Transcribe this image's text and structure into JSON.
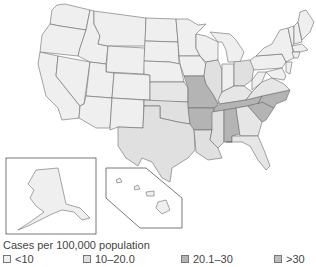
{
  "colors": {
    "lt10": "#efefef",
    "10to20": "#e0e0e0",
    "20to30": "#b4b4b4",
    "gt30": "#bcbcbc",
    "border": "#6a6a6a"
  },
  "legend": {
    "title": "Cases per 100,000 population",
    "items": [
      {
        "label": "<10",
        "class": "lt10"
      },
      {
        "label": "10–20.0",
        "class": "10to20"
      },
      {
        "label": "20.1–30",
        "class": "20to30"
      },
      {
        "label": ">30",
        "class": "gt30"
      }
    ]
  },
  "map": {
    "region": "United States",
    "insets": [
      "Alaska",
      "Hawaii"
    ],
    "states_20_1_to_30": [
      "Missouri",
      "Arkansas",
      "Tennessee",
      "Alabama",
      "North Carolina",
      "South Carolina"
    ],
    "states_10_to_20": [
      "Texas",
      "Oklahoma",
      "Louisiana",
      "Mississippi",
      "Georgia",
      "Florida",
      "Illinois",
      "Ohio",
      "Kentucky",
      "Virginia",
      "Kansas"
    ],
    "states_lt_10": [
      "Washington",
      "Oregon",
      "California",
      "Nevada",
      "Idaho",
      "Montana",
      "Wyoming",
      "Utah",
      "Arizona",
      "Colorado",
      "New Mexico",
      "North Dakota",
      "South Dakota",
      "Nebraska",
      "Minnesota",
      "Iowa",
      "Wisconsin",
      "Michigan",
      "Indiana",
      "West Virginia",
      "Pennsylvania",
      "New York",
      "Maine",
      "Vermont",
      "New Hampshire",
      "Massachusetts",
      "Connecticut",
      "Rhode Island",
      "New Jersey",
      "Delaware",
      "Maryland",
      "Alaska",
      "Hawaii"
    ]
  }
}
